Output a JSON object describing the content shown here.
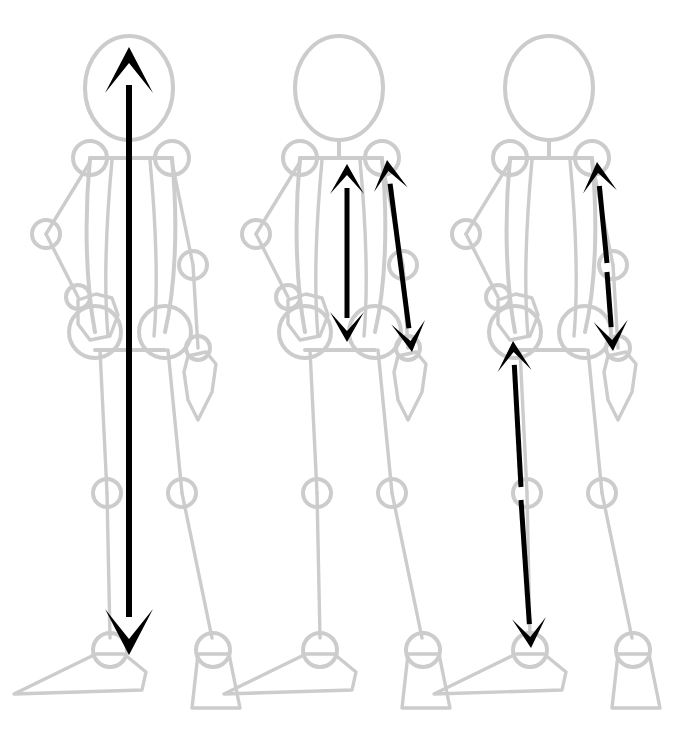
{
  "figure": {
    "canvas": {
      "width": 674,
      "height": 735,
      "background": "#ffffff"
    },
    "colors": {
      "skeleton": "#cccccc",
      "arrow": "#000000",
      "background": "#ffffff"
    },
    "panel_count": 3,
    "panels": [
      {
        "id": "panel-1",
        "label": "Panel 1 - full body height",
        "x_offset": 0,
        "arrows": [
          {
            "name": "body-height-arrow",
            "kind": "double-headed",
            "from_joint": "head-top",
            "to_joint": "ankle",
            "x1": 129,
            "y1": 47,
            "x2": 129,
            "y2": 655,
            "orientation": "vertical"
          }
        ]
      },
      {
        "id": "panel-2",
        "label": "Panel 2 - torso and full arm",
        "x_offset": 210,
        "arrows": [
          {
            "name": "torso-length-arrow",
            "kind": "double-headed",
            "from_joint": "shoulder-center",
            "to_joint": "hip-center",
            "x1": 347,
            "y1": 164,
            "x2": 347,
            "y2": 342,
            "orientation": "vertical"
          },
          {
            "name": "arm-length-arrow",
            "kind": "double-headed",
            "from_joint": "shoulder",
            "to_joint": "wrist",
            "x1": 387,
            "y1": 160,
            "x2": 412,
            "y2": 352,
            "orientation": "slanted"
          }
        ]
      },
      {
        "id": "panel-3",
        "label": "Panel 3 - upper arm, forearm and leg segments",
        "x_offset": 420,
        "arrows": [
          {
            "name": "upper-arm-arrow",
            "kind": "single-headed",
            "from_joint": "elbow",
            "to_joint": "shoulder",
            "x1": 607,
            "y1": 263,
            "x2": 597,
            "y2": 162,
            "orientation": "slanted-up"
          },
          {
            "name": "forearm-arrow",
            "kind": "single-headed",
            "from_joint": "elbow",
            "to_joint": "wrist",
            "x1": 607,
            "y1": 272,
            "x2": 613,
            "y2": 351,
            "orientation": "slanted-down"
          },
          {
            "name": "thigh-arrow",
            "kind": "single-headed",
            "from_joint": "knee",
            "to_joint": "hip",
            "x1": 521,
            "y1": 487,
            "x2": 513,
            "y2": 341,
            "orientation": "slanted-up"
          },
          {
            "name": "shank-arrow",
            "kind": "single-headed",
            "from_joint": "knee",
            "to_joint": "ankle",
            "x1": 521,
            "y1": 500,
            "x2": 531,
            "y2": 648,
            "orientation": "slanted-down"
          }
        ]
      }
    ],
    "skeleton_joints": {
      "head_center": {
        "x": 129,
        "y": 88,
        "rx": 44,
        "ry": 52
      },
      "neck_top": {
        "x": 129,
        "y": 140
      },
      "neck_bottom": {
        "x": 129,
        "y": 158
      },
      "shoulder_near": {
        "x": 172,
        "y": 158,
        "r": 17
      },
      "shoulder_far": {
        "x": 90,
        "y": 158,
        "r": 17
      },
      "elbow_near": {
        "x": 193,
        "y": 265,
        "r": 14
      },
      "elbow_far": {
        "x": 46,
        "y": 234,
        "r": 14
      },
      "wrist_near": {
        "x": 198,
        "y": 348,
        "r": 12
      },
      "wrist_far": {
        "x": 78,
        "y": 297,
        "r": 12
      },
      "hip_near": {
        "x": 165,
        "y": 332,
        "r": 26
      },
      "hip_far": {
        "x": 95,
        "y": 332,
        "r": 26
      },
      "knee_near": {
        "x": 182,
        "y": 493,
        "r": 14
      },
      "knee_far": {
        "x": 107,
        "y": 493,
        "r": 14
      },
      "ankle_near": {
        "x": 213,
        "y": 650,
        "r": 17
      },
      "ankle_far": {
        "x": 110,
        "y": 650,
        "r": 17
      }
    }
  }
}
